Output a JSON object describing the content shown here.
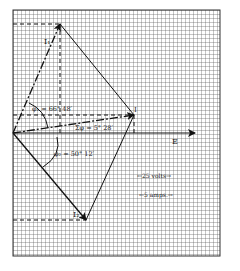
{
  "diagram": {
    "type": "phasor diagram on graph paper",
    "grid": {
      "x0": 13,
      "y0": 10,
      "x1": 220,
      "y1": 256,
      "spacing": 4,
      "line_color": "#555555"
    },
    "origin": {
      "x": 13,
      "y": 133
    },
    "vectors": {
      "E": {
        "label": "E",
        "tip": {
          "x": 195,
          "y": 133
        }
      },
      "I": {
        "label": "I",
        "tip": {
          "x": 134,
          "y": 115
        }
      },
      "I1": {
        "label": "I₁",
        "tip": {
          "x": 60,
          "y": 24
        }
      },
      "I2": {
        "label": "I₂",
        "tip": {
          "x": 86,
          "y": 220
        }
      }
    },
    "angles": {
      "phi1": {
        "label": "φ₁ = 66° 48′"
      },
      "phi": {
        "label": "Σφ = 5° 28′"
      },
      "phi2": {
        "label": "φ₂ = 50° 12′"
      }
    },
    "scales": {
      "volts": "←25 volts→",
      "amps": "←5 amps.→"
    }
  }
}
